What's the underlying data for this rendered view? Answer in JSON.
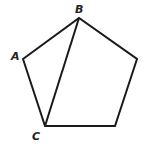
{
  "diagram": {
    "type": "pentagon-with-diagonal",
    "stroke_color": "#1a1a1a",
    "background": "#ffffff",
    "vertices": {
      "A": [
        23,
        59
      ],
      "B": [
        79,
        18
      ],
      "R": [
        137,
        59
      ],
      "D": [
        115,
        126
      ],
      "C": [
        45,
        126
      ]
    },
    "labels": {
      "A": "A",
      "B": "B",
      "C": "C"
    },
    "diagonal": [
      "B",
      "C"
    ]
  }
}
